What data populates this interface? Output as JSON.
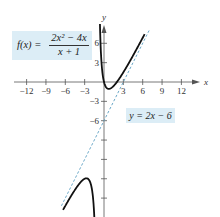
{
  "chart_data": {
    "type": "line",
    "title": "",
    "xlabel": "x",
    "ylabel": "y",
    "xlim": [
      -13.5,
      17
    ],
    "ylim": [
      -21,
      10
    ],
    "grid": false,
    "x_ticks": [
      -12,
      -9,
      -6,
      -3,
      3,
      6,
      9,
      12
    ],
    "x_tick_labels": [
      "−12",
      "−9",
      "−6",
      "−3",
      "3",
      "6",
      "9",
      "12"
    ],
    "y_ticks": [
      6,
      3,
      -3,
      -6,
      -9,
      -12,
      -15,
      -18
    ],
    "y_tick_labels": [
      "6",
      "3",
      "−3",
      "−6"
    ],
    "series": [
      {
        "name": "f(x) = (2x^2 - 4x)/(x + 1)",
        "style": "solid",
        "color": "#111111",
        "branches": [
          {
            "x": [
              -6.3,
              -5.5,
              -4.5,
              -3.5,
              -2.73,
              -2.0,
              -1.6,
              -1.4
            ],
            "y": [
              -22.2,
              -19.6,
              -17.1,
              -15.3,
              -14.9,
              -16.0,
              -19.2,
              -24.5
            ]
          },
          {
            "x": [
              -0.84,
              -0.75,
              -0.6,
              -0.4,
              -0.2,
              0.0,
              0.45,
              1.0,
              2.0,
              3.0,
              4.0,
              5.0,
              6.3
            ],
            "y": [
              9.0,
              7.5,
              5.4,
              3.4,
              1.1,
              0.0,
              -0.92,
              -1.0,
              0.0,
              1.5,
              3.2,
              5.0,
              7.4
            ]
          }
        ]
      },
      {
        "name": "y = 2x - 6",
        "style": "dashed",
        "color": "#6aa8c8",
        "x": [
          -6.6,
          7.0
        ],
        "y": [
          -19.2,
          8.0
        ]
      }
    ],
    "annotations": [
      {
        "text": "f(x) = (2x^2 - 4x)/(x + 1)",
        "position": "upper-left"
      },
      {
        "text": "y = 2x − 6",
        "position": "right of slant asymptote"
      }
    ]
  },
  "labels": {
    "f_lhs": "f(x) =",
    "f_num": "2x² − 4x",
    "f_den": "x + 1",
    "line": "y = 2x − 6",
    "x_axis": "x",
    "y_axis": "y"
  },
  "colors": {
    "curve": "#111111",
    "asymptote": "#6aa8c8",
    "label_bg": "#dcedf6",
    "axis": "#555555"
  }
}
